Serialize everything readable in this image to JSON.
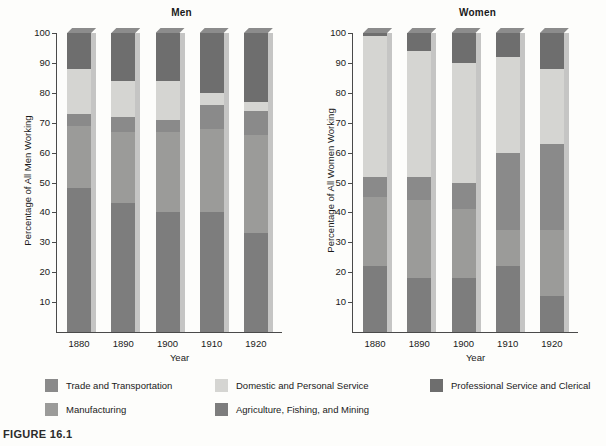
{
  "figure": {
    "caption": "FIGURE 16.1"
  },
  "legend": {
    "items": [
      {
        "label": "Trade and Transportation",
        "color": "#8a8a8a",
        "col": 0,
        "row": 0
      },
      {
        "label": "Domestic and Personal Service",
        "color": "#d5d5d2",
        "col": 1,
        "row": 0
      },
      {
        "label": "Professional Service and Clerical",
        "color": "#6e6e6e",
        "col": 2,
        "row": 0
      },
      {
        "label": "Manufacturing",
        "color": "#9b9b99",
        "col": 0,
        "row": 1
      },
      {
        "label": "Agriculture, Fishing, and Mining",
        "color": "#7d7d7d",
        "col": 1,
        "row": 1
      }
    ]
  },
  "chart_data": [
    {
      "type": "bar",
      "title": "Men",
      "xlabel": "Year",
      "ylabel": "Percentage of All Men Working",
      "ylim": [
        0,
        100
      ],
      "yticks": [
        10,
        20,
        30,
        40,
        50,
        60,
        70,
        80,
        90,
        100
      ],
      "categories": [
        "1880",
        "1890",
        "1900",
        "1910",
        "1920"
      ],
      "stacked": true,
      "grid": false,
      "legend_position": "bottom",
      "series": [
        {
          "name": "Agriculture, Fishing, and Mining",
          "color": "#7d7d7d",
          "values": [
            48,
            43,
            40,
            40,
            33
          ]
        },
        {
          "name": "Manufacturing",
          "color": "#9b9b99",
          "values": [
            21,
            24,
            27,
            28,
            33
          ]
        },
        {
          "name": "Trade and Transportation",
          "color": "#8a8a8a",
          "values": [
            4,
            5,
            4,
            8,
            8
          ]
        },
        {
          "name": "Domestic and Personal Service",
          "color": "#d5d5d2",
          "values": [
            15,
            12,
            13,
            4,
            3
          ]
        },
        {
          "name": "Professional Service and Clerical",
          "color": "#6e6e6e",
          "values": [
            12,
            16,
            16,
            20,
            23
          ]
        }
      ]
    },
    {
      "type": "bar",
      "title": "Women",
      "xlabel": "Year",
      "ylabel": "Percentage of All Women Working",
      "ylim": [
        0,
        100
      ],
      "yticks": [
        10,
        20,
        30,
        40,
        50,
        60,
        70,
        80,
        90,
        100
      ],
      "categories": [
        "1880",
        "1890",
        "1900",
        "1910",
        "1920"
      ],
      "stacked": true,
      "grid": false,
      "legend_position": "bottom",
      "series": [
        {
          "name": "Agriculture, Fishing, and Mining",
          "color": "#7d7d7d",
          "values": [
            22,
            18,
            18,
            22,
            12
          ]
        },
        {
          "name": "Manufacturing",
          "color": "#9b9b99",
          "values": [
            23,
            26,
            23,
            12,
            22
          ]
        },
        {
          "name": "Trade and Transportation",
          "color": "#8a8a8a",
          "values": [
            7,
            8,
            9,
            26,
            29
          ]
        },
        {
          "name": "Domestic and Personal Service",
          "color": "#d5d5d2",
          "values": [
            47,
            42,
            40,
            32,
            25
          ]
        },
        {
          "name": "Professional Service and Clerical",
          "color": "#6e6e6e",
          "values": [
            1,
            6,
            10,
            8,
            12
          ]
        }
      ]
    }
  ]
}
